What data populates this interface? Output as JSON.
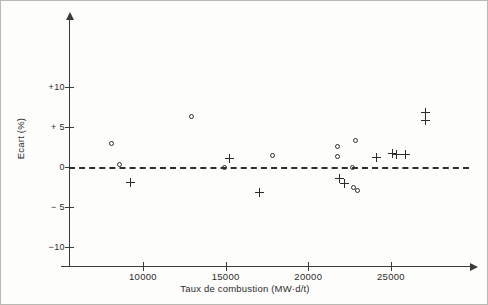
{
  "chart_data": {
    "type": "scatter",
    "title": "",
    "xlabel": "Taux de combustion (MW·d/t)",
    "ylabel": "Ecart (%)",
    "xlim": [
      6500,
      28500
    ],
    "ylim": [
      -12,
      13
    ],
    "xticks": [
      10000,
      15000,
      20000,
      25000
    ],
    "xtick_labels": [
      "10000",
      "15000",
      "20000",
      "25000"
    ],
    "yticks": [
      10,
      5,
      0,
      -5,
      -10
    ],
    "ytick_labels": [
      "+10",
      "+ 5",
      "0",
      "− 5",
      "−10"
    ],
    "grid": false,
    "legend": null,
    "reference_lines": [
      {
        "name": "zero-line",
        "axis": "y",
        "value": 0,
        "style": "dashed"
      }
    ],
    "series": [
      {
        "name": "Circle measurements",
        "marker": "circle",
        "points": [
          {
            "x": 8100,
            "y": 3.0
          },
          {
            "x": 8600,
            "y": 0.3
          },
          {
            "x": 12950,
            "y": 6.3
          },
          {
            "x": 14950,
            "y": 0.0
          },
          {
            "x": 17850,
            "y": 1.5
          },
          {
            "x": 21750,
            "y": 2.6
          },
          {
            "x": 21750,
            "y": 1.3
          },
          {
            "x": 22850,
            "y": 3.3
          },
          {
            "x": 22700,
            "y": 0.0
          },
          {
            "x": 22750,
            "y": -2.6
          },
          {
            "x": 22950,
            "y": -2.9
          }
        ]
      },
      {
        "name": "Plus measurements",
        "marker": "plus",
        "points": [
          {
            "x": 9250,
            "y": -1.9
          },
          {
            "x": 15250,
            "y": 1.1
          },
          {
            "x": 17050,
            "y": -3.2
          },
          {
            "x": 21900,
            "y": -1.4
          },
          {
            "x": 22200,
            "y": -2.0
          },
          {
            "x": 24100,
            "y": 1.2
          },
          {
            "x": 25100,
            "y": 1.7
          },
          {
            "x": 25350,
            "y": 1.6
          },
          {
            "x": 25900,
            "y": 1.6
          },
          {
            "x": 27100,
            "y": 6.8
          },
          {
            "x": 27100,
            "y": 5.8
          }
        ]
      }
    ]
  }
}
